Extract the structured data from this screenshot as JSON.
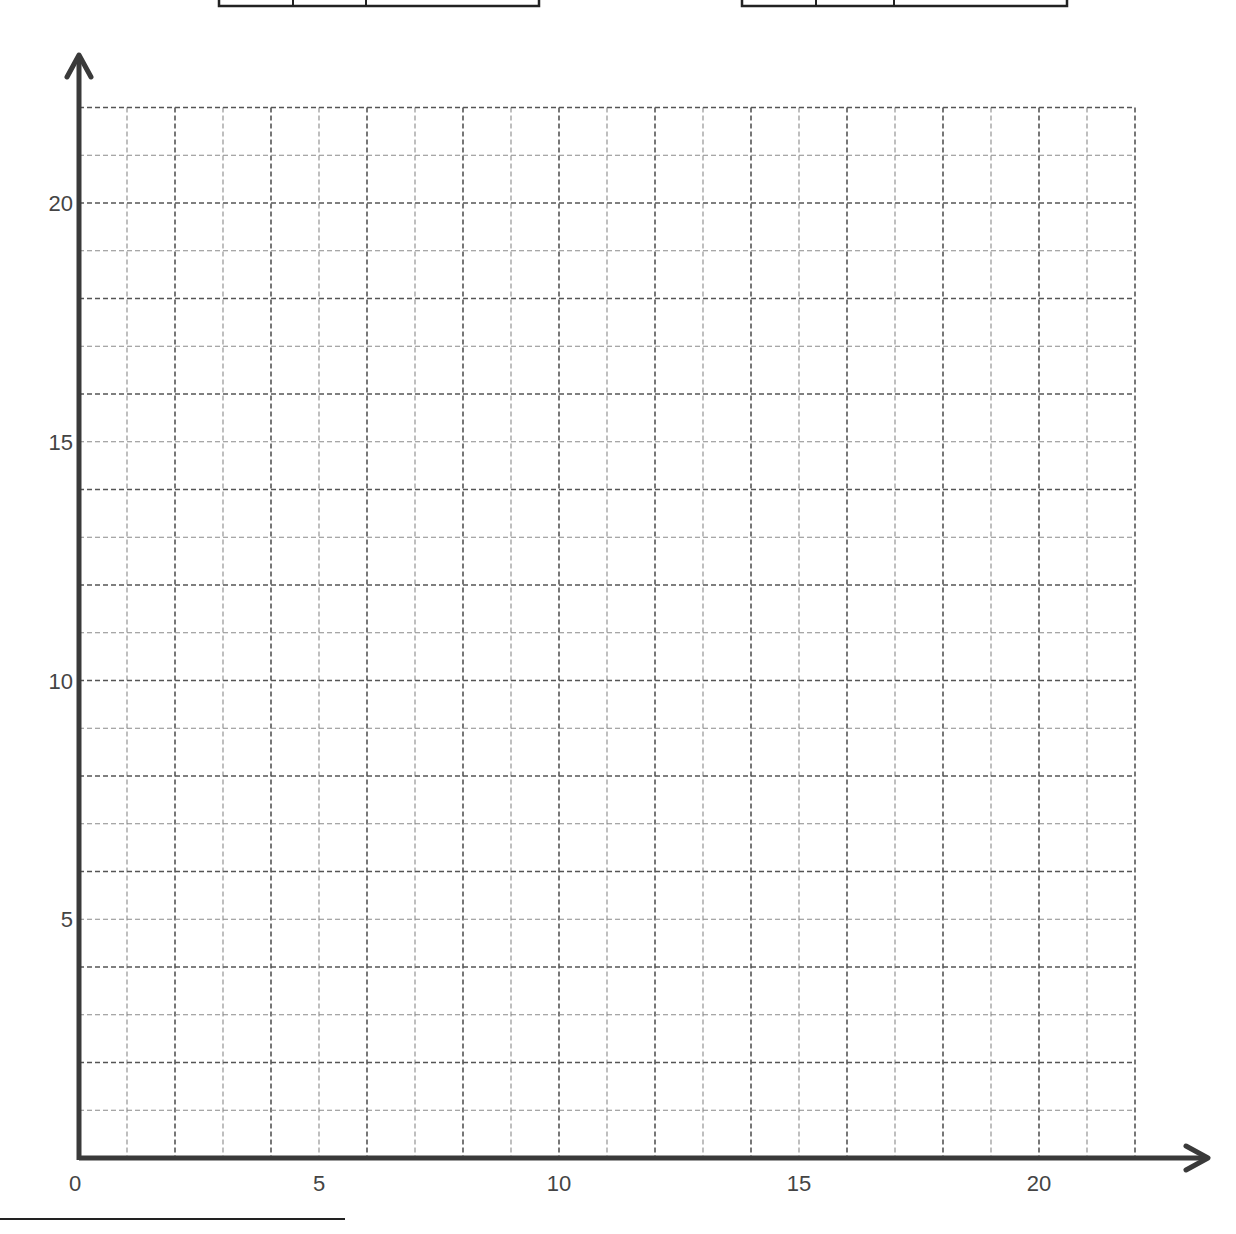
{
  "worksheet": {
    "top_tables": [
      {
        "x": 219,
        "width": 320,
        "dividers": [
          293,
          366
        ]
      },
      {
        "x": 742,
        "width": 325,
        "dividers": [
          816,
          894
        ]
      }
    ],
    "answer_line": {
      "x1": 0,
      "x2": 345,
      "y": 1219
    }
  },
  "colors": {
    "axis": "#3a3a3a",
    "major_grid": "#555555",
    "minor_grid": "#8a8a8a",
    "label": "#444444",
    "table_border": "#222222"
  },
  "chart_data": {
    "type": "scatter",
    "title": "",
    "xlabel": "",
    "ylabel": "",
    "x": [],
    "y": [],
    "series": [],
    "xlim": [
      0,
      22
    ],
    "ylim": [
      0,
      22
    ],
    "x_ticks": [
      0,
      5,
      10,
      15,
      20
    ],
    "y_ticks": [
      5,
      10,
      15,
      20
    ],
    "x_tick_labels": [
      "0",
      "5",
      "10",
      "15",
      "20"
    ],
    "y_tick_labels": [
      "5",
      "10",
      "15",
      "20"
    ],
    "grid": true,
    "grid_style": "dashed",
    "grid_step": 1,
    "legend": null,
    "note": "Blank graph paper with arrowed axes; no data plotted"
  },
  "geometry": {
    "origin_x": 79,
    "origin_y": 1158,
    "unit_x": 48.0,
    "unit_y": 47.75,
    "x_arrow_end": 1208,
    "y_arrow_end": 55
  }
}
